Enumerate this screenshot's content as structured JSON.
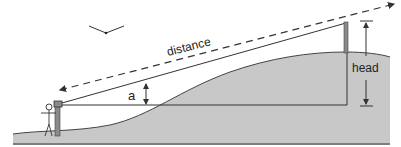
{
  "diagram": {
    "type": "surveying-head-measurement",
    "labels": {
      "distance": "distance",
      "angle": "a",
      "head": "head"
    },
    "colors": {
      "ground_fill": "#c8c8c8",
      "ground_edge": "#555555",
      "line": "#333333",
      "staff": "#8a8a8a",
      "background": "#ffffff"
    },
    "elements": [
      "ground-profile",
      "surveyor-figure",
      "instrument-tripod",
      "sight-line",
      "horizontal-reference-line",
      "staff-pole",
      "distance-dashed-arrow",
      "angle-arrow",
      "head-arrow",
      "bird"
    ]
  }
}
